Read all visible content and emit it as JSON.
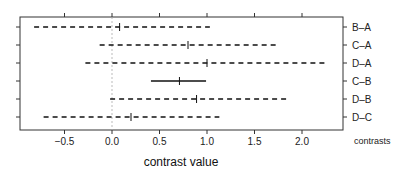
{
  "chart_data": {
    "type": "interval",
    "title": "",
    "xlabel": "contrast value",
    "ylabel": "contrasts",
    "xlim": [
      -0.97,
      2.43
    ],
    "x_ticks": [
      -0.5,
      0.0,
      0.5,
      1.0,
      1.5,
      2.0
    ],
    "x_tick_labels": [
      "-0.5",
      "0.0",
      "0.5",
      "1.0",
      "1.5",
      "2.0"
    ],
    "reference_line": 0.0,
    "grid": false,
    "legend": null,
    "categories": [
      "B–A",
      "C–A",
      "D–A",
      "C–B",
      "D–B",
      "D–C"
    ],
    "series": [
      {
        "name": "B–A",
        "lower": -0.82,
        "estimate": 0.08,
        "upper": 1.03,
        "line": "dashed"
      },
      {
        "name": "C–A",
        "lower": -0.13,
        "estimate": 0.8,
        "upper": 1.74,
        "line": "dashed"
      },
      {
        "name": "D–A",
        "lower": -0.28,
        "estimate": 1.0,
        "upper": 2.25,
        "line": "dashed"
      },
      {
        "name": "C–B",
        "lower": 0.41,
        "estimate": 0.71,
        "upper": 0.99,
        "line": "solid"
      },
      {
        "name": "D–B",
        "lower": -0.02,
        "estimate": 0.89,
        "upper": 1.84,
        "line": "dashed"
      },
      {
        "name": "D–C",
        "lower": -0.72,
        "estimate": 0.2,
        "upper": 1.13,
        "line": "dashed"
      }
    ]
  }
}
